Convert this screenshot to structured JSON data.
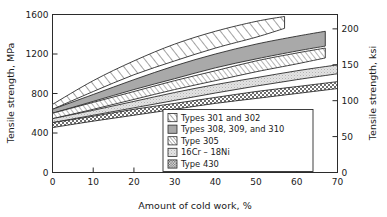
{
  "chart_data": {
    "type": "area",
    "title": "",
    "xlabel": "Amount of cold work, %",
    "ylabel": "Tensile strength, MPa",
    "ylabel_right": "Tensile strength, ksi",
    "xlim": [
      0,
      70
    ],
    "ylim": [
      0,
      1600
    ],
    "ylim_right": [
      0,
      220
    ],
    "xticks": [
      "0",
      "10",
      "20",
      "30",
      "40",
      "50",
      "60",
      "70"
    ],
    "xtick_values": [
      0,
      10,
      20,
      30,
      40,
      50,
      60,
      70
    ],
    "yticks": [
      "0",
      "400",
      "800",
      "1200",
      "1600"
    ],
    "ytick_values": [
      0,
      400,
      800,
      1200,
      1600
    ],
    "yticks_right": [
      "0",
      "50",
      "100",
      "150",
      "200"
    ],
    "ytick_values_right": [
      0,
      50,
      100,
      150,
      200
    ],
    "grid": false,
    "legend_position": "lower-center-right",
    "series": [
      {
        "name": "Types 301 and 302",
        "pattern": "diagonal-hatch-wide",
        "x": [
          0,
          10,
          20,
          30,
          40,
          50,
          57
        ],
        "upper": [
          690,
          930,
          1130,
          1300,
          1430,
          1530,
          1580
        ],
        "lower": [
          640,
          820,
          990,
          1130,
          1260,
          1370,
          1460
        ]
      },
      {
        "name": "Types 308, 309, and 310",
        "pattern": "solid-gray",
        "x": [
          0,
          10,
          20,
          30,
          40,
          50,
          60,
          67
        ],
        "upper": [
          640,
          790,
          940,
          1080,
          1200,
          1300,
          1380,
          1430
        ],
        "lower": [
          600,
          720,
          840,
          950,
          1060,
          1150,
          1230,
          1280
        ]
      },
      {
        "name": "Type 305",
        "pattern": "diagonal-hatch-fine",
        "x": [
          0,
          10,
          20,
          30,
          40,
          50,
          60,
          67
        ],
        "upper": [
          600,
          710,
          820,
          930,
          1030,
          1130,
          1210,
          1260
        ],
        "lower": [
          545,
          640,
          740,
          840,
          930,
          1020,
          1100,
          1160
        ]
      },
      {
        "name": "16Cr – 18Ni",
        "pattern": "light-stipple",
        "x": [
          0,
          10,
          20,
          30,
          40,
          50,
          60,
          70
        ],
        "upper": [
          545,
          630,
          720,
          810,
          890,
          960,
          1030,
          1090
        ],
        "lower": [
          505,
          580,
          655,
          730,
          805,
          875,
          940,
          1000
        ]
      },
      {
        "name": "Type 430",
        "pattern": "cross-checker",
        "x": [
          0,
          10,
          20,
          30,
          40,
          50,
          60,
          70
        ],
        "upper": [
          505,
          570,
          640,
          700,
          760,
          820,
          870,
          920
        ],
        "lower": [
          455,
          520,
          580,
          640,
          700,
          750,
          800,
          850
        ]
      }
    ]
  },
  "legend": {
    "items": [
      {
        "label": "Types 301 and 302"
      },
      {
        "label": "Types 308, 309, and 310"
      },
      {
        "label": "Type 305"
      },
      {
        "label": "16Cr – 18Ni"
      },
      {
        "label": "Type 430"
      }
    ]
  }
}
